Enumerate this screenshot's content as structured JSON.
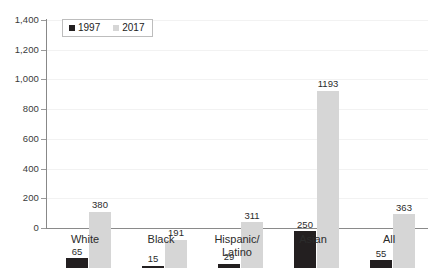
{
  "chart_data": {
    "type": "bar",
    "title": "",
    "xlabel": "",
    "ylabel": "",
    "ylim": [
      0,
      1400
    ],
    "ytick_step": 200,
    "grid": true,
    "legend_position": "top-left",
    "categories": [
      "White",
      "Black",
      "Hispanic/\nLatino",
      "Asian",
      "All"
    ],
    "series": [
      {
        "name": "1997",
        "color": "#231f20",
        "values": [
          65,
          15,
          29,
          250,
          55
        ],
        "labels": [
          "65",
          "15",
          "29",
          "250",
          "55"
        ]
      },
      {
        "name": "2017",
        "color": "#d6d6d6",
        "values": [
          380,
          191,
          311,
          1193,
          363
        ],
        "labels": [
          "380",
          "191",
          "311",
          "1193",
          "363"
        ]
      }
    ],
    "ytick_labels": [
      "1,400",
      "1,200",
      "1,000",
      "800",
      "600",
      "400",
      "200",
      "0"
    ],
    "ytick_values": [
      1400,
      1200,
      1000,
      800,
      600,
      400,
      200,
      0
    ]
  },
  "legend": {
    "items": [
      {
        "label": "1997",
        "color": "#231f20"
      },
      {
        "label": "2017",
        "color": "#d6d6d6"
      }
    ]
  },
  "axis": {
    "y": {
      "t0": "1,400",
      "t1": "1,200",
      "t2": "1,000",
      "t3": "800",
      "t4": "600",
      "t5": "400",
      "t6": "200",
      "t7": "0"
    }
  },
  "categories": {
    "c0": "White",
    "c1": "Black",
    "c2": "Hispanic/\nLatino",
    "c3": "Asian",
    "c4": "All"
  },
  "values": {
    "white_1997": "65",
    "white_2017": "380",
    "black_1997": "15",
    "black_2017": "191",
    "hispanic_1997": "29",
    "hispanic_2017": "311",
    "asian_1997": "250",
    "asian_2017": "1193",
    "all_1997": "55",
    "all_2017": "363"
  }
}
